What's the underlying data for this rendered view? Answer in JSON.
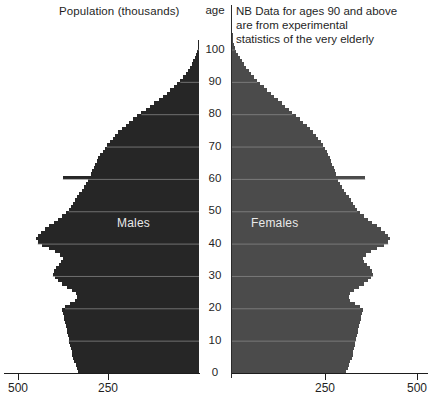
{
  "header": {
    "population_title": "Population (thousands)",
    "note_lines": [
      "NB Data for ages 90 and above",
      "are from experimental",
      "statistics of the very elderly"
    ]
  },
  "axis": {
    "age_header": "age",
    "age_ticks": [
      "100",
      "90",
      "80",
      "70",
      "60",
      "50",
      "40",
      "30",
      "20",
      "10",
      "0"
    ],
    "left_tick_labels": [
      "500",
      "250"
    ],
    "right_tick_labels": [
      "250",
      "500"
    ]
  },
  "series_labels": {
    "males": "Males",
    "females": "Females"
  },
  "colors": {
    "males_fill": "#262626",
    "females_fill": "#4b4b4b",
    "gridline": "#8a8a8a",
    "axis": "#1d1d1d",
    "text": "#1f1f1f",
    "label_text": "#e9e9e9",
    "background": "#ffffff"
  },
  "chart_data": {
    "type": "bar",
    "title": "Population (thousands)",
    "subtitle": "NB Data for ages 90 and above are from experimental statistics of the very elderly",
    "orientation": "horizontal-population-pyramid",
    "xlabel": "Population (thousands)",
    "ylabel": "age",
    "xlim_left": [
      500,
      0
    ],
    "xlim_right": [
      0,
      500
    ],
    "ylim": [
      0,
      104
    ],
    "x_ticks_left": [
      500,
      250
    ],
    "x_ticks_right": [
      250,
      500
    ],
    "y_ticks": [
      0,
      10,
      20,
      30,
      40,
      50,
      60,
      70,
      80,
      90,
      100
    ],
    "grid": "horizontal-only",
    "legend": "in-plot-labels",
    "ages": [
      0,
      1,
      2,
      3,
      4,
      5,
      6,
      7,
      8,
      9,
      10,
      11,
      12,
      13,
      14,
      15,
      16,
      17,
      18,
      19,
      20,
      21,
      22,
      23,
      24,
      25,
      26,
      27,
      28,
      29,
      30,
      31,
      32,
      33,
      34,
      35,
      36,
      37,
      38,
      39,
      40,
      41,
      42,
      43,
      44,
      45,
      46,
      47,
      48,
      49,
      50,
      51,
      52,
      53,
      54,
      55,
      56,
      57,
      58,
      59,
      60,
      61,
      62,
      63,
      64,
      65,
      66,
      67,
      68,
      69,
      70,
      71,
      72,
      73,
      74,
      75,
      76,
      77,
      78,
      79,
      80,
      81,
      82,
      83,
      84,
      85,
      86,
      87,
      88,
      89,
      90,
      91,
      92,
      93,
      94,
      95,
      96,
      97,
      98,
      99,
      100,
      101,
      102,
      103,
      104
    ],
    "series": [
      {
        "name": "Males",
        "side": "left",
        "values": [
          335,
          338,
          342,
          346,
          350,
          352,
          354,
          356,
          358,
          360,
          362,
          364,
          366,
          368,
          370,
          372,
          374,
          376,
          378,
          380,
          372,
          358,
          344,
          338,
          342,
          352,
          366,
          380,
          392,
          400,
          406,
          404,
          398,
          390,
          382,
          378,
          386,
          400,
          418,
          436,
          448,
          452,
          448,
          440,
          428,
          416,
          404,
          392,
          380,
          370,
          362,
          356,
          350,
          344,
          338,
          332,
          326,
          320,
          314,
          308,
          378,
          300,
          296,
          292,
          288,
          284,
          280,
          274,
          268,
          262,
          256,
          248,
          240,
          232,
          224,
          214,
          204,
          194,
          184,
          172,
          160,
          148,
          136,
          124,
          112,
          100,
          90,
          80,
          70,
          60,
          52,
          44,
          37,
          31,
          25,
          20,
          16,
          12,
          9,
          6,
          4,
          3,
          2,
          1,
          1
        ]
      },
      {
        "name": "Females",
        "side": "right",
        "values": [
          318,
          321,
          325,
          329,
          333,
          335,
          337,
          339,
          341,
          343,
          345,
          347,
          349,
          351,
          353,
          355,
          357,
          359,
          361,
          363,
          356,
          342,
          329,
          324,
          328,
          338,
          352,
          366,
          378,
          386,
          392,
          390,
          384,
          376,
          368,
          364,
          372,
          386,
          404,
          422,
          434,
          438,
          434,
          426,
          414,
          402,
          390,
          378,
          366,
          356,
          348,
          342,
          336,
          330,
          324,
          318,
          312,
          306,
          300,
          294,
          370,
          288,
          285,
          282,
          279,
          276,
          273,
          268,
          263,
          258,
          253,
          246,
          239,
          232,
          225,
          216,
          207,
          198,
          189,
          178,
          168,
          158,
          148,
          138,
          128,
          118,
          108,
          98,
          88,
          78,
          70,
          62,
          54,
          47,
          40,
          33,
          27,
          21,
          16,
          12,
          9,
          6,
          4,
          3,
          2
        ]
      }
    ]
  }
}
